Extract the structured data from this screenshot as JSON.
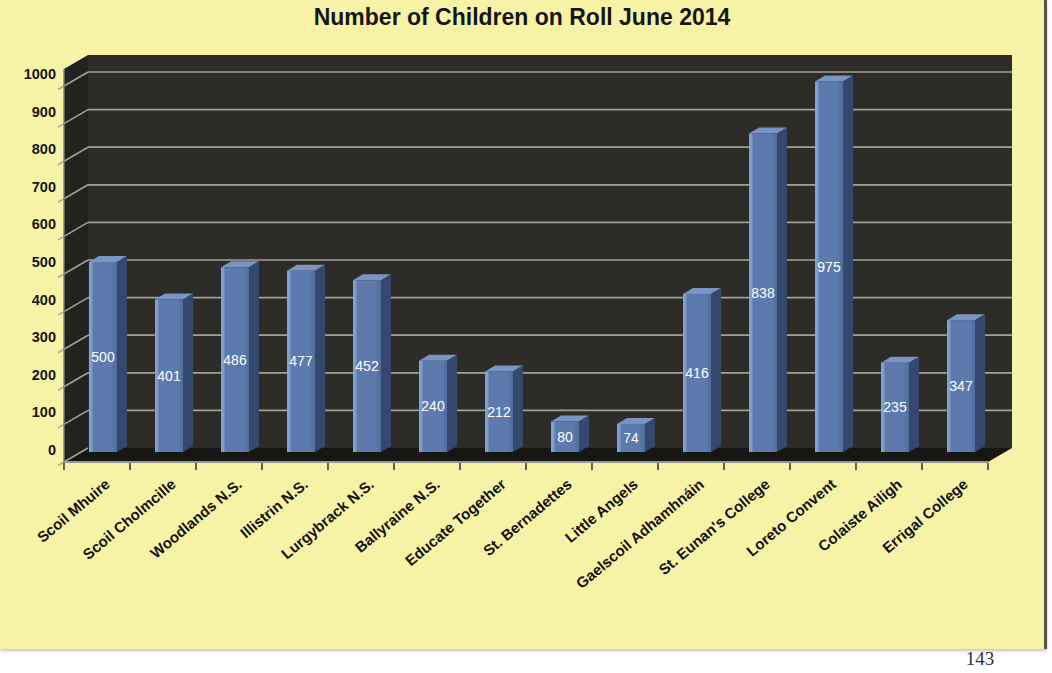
{
  "page": {
    "number": "143",
    "sheet_background": "#F7F3A6",
    "border_color": "#55544C"
  },
  "chart_data": {
    "type": "bar",
    "style": "3d-column",
    "title": "Number of Children on Roll June 2014",
    "categories": [
      "Scoil Mhuire",
      "Scoil Cholmcille",
      "Woodlands N.S.",
      "Illistrin N.S.",
      "Lurgybrack N.S.",
      "Ballyraine N.S.",
      "Educate Together",
      "St. Bernadettes",
      "Little Angels",
      "Gaelscoil Adhamhnáin",
      "St. Eunan's College",
      "Loreto Convent",
      "Colaiste Ailigh",
      "Errigal College"
    ],
    "values": [
      500,
      401,
      486,
      477,
      452,
      240,
      212,
      80,
      74,
      416,
      838,
      975,
      235,
      347
    ],
    "xlabel": "",
    "ylabel": "",
    "ylim": [
      0,
      1000
    ],
    "yticks": [
      0,
      100,
      200,
      300,
      400,
      500,
      600,
      700,
      800,
      900,
      1000
    ],
    "grid": true,
    "legend": false,
    "colors": {
      "bar_front": "#5C7AAE",
      "bar_highlight": "#84A0CC",
      "bar_side": "#35486E",
      "bar_top": "#7A94C4",
      "wall": "#2D2C29",
      "side_wall": "#222220",
      "floor": "#161614",
      "gridline": "#A8A89D",
      "value_label": "#FFFFFF",
      "axis_text": "#161616"
    }
  }
}
